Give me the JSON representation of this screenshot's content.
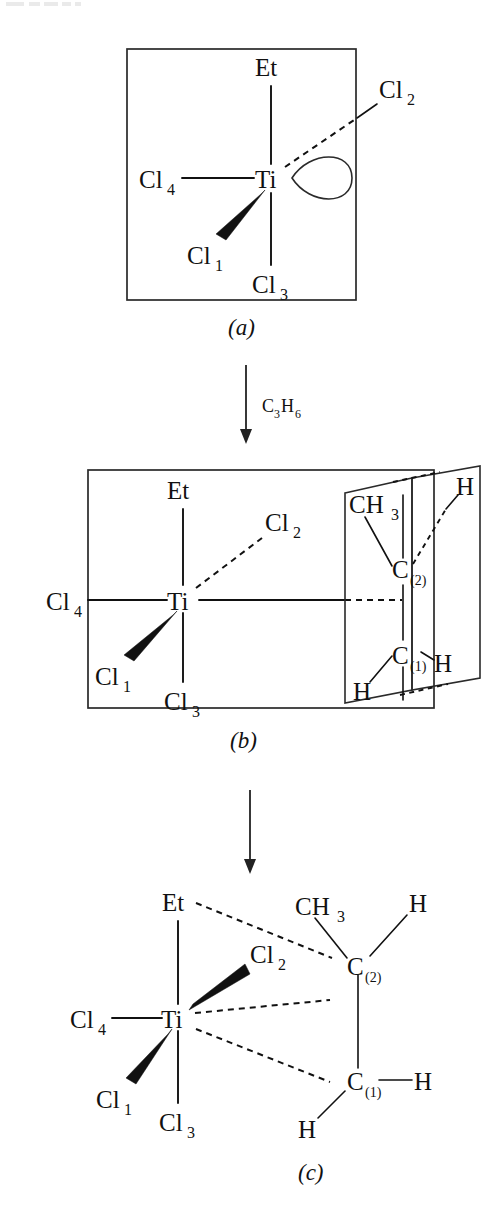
{
  "figure": {
    "kind": "reaction-mechanism-scheme",
    "background_color": "#ffffff",
    "line_color": "#111111"
  },
  "panels": [
    {
      "id": "a",
      "caption": "(a)",
      "has_box": true,
      "center_atom": "Ti",
      "ligands": [
        {
          "label": "Et",
          "sub": "",
          "bond": "plain",
          "position": "up"
        },
        {
          "label": "Cl",
          "sub": "4",
          "bond": "plain",
          "position": "left"
        },
        {
          "label": "Cl",
          "sub": "3",
          "bond": "plain",
          "position": "down"
        },
        {
          "label": "Cl",
          "sub": "2",
          "bond": "dashed",
          "position": "upper-right"
        },
        {
          "label": "Cl",
          "sub": "1",
          "bond": "wedge",
          "position": "lower-left"
        }
      ],
      "vacant_site": {
        "shape": "lobe",
        "label": ""
      }
    },
    {
      "id": "b",
      "caption": "(b)",
      "has_box": true,
      "center_atom": "Ti",
      "ligands": [
        {
          "label": "Et",
          "sub": "",
          "bond": "plain",
          "position": "up"
        },
        {
          "label": "Cl",
          "sub": "4",
          "bond": "plain",
          "position": "left"
        },
        {
          "label": "Cl",
          "sub": "3",
          "bond": "plain",
          "position": "down"
        },
        {
          "label": "Cl",
          "sub": "2",
          "bond": "dashed",
          "position": "upper-right"
        },
        {
          "label": "Cl",
          "sub": "1",
          "bond": "wedge",
          "position": "lower-left"
        }
      ],
      "alkene_plane": {
        "carbons": [
          {
            "label": "C",
            "sub": "(2)",
            "substituents": [
              "CH3",
              "H"
            ]
          },
          {
            "label": "C",
            "sub": "(1)",
            "substituents": [
              "H",
              "H"
            ]
          }
        ],
        "methyl_label": "CH",
        "methyl_sub": "3",
        "hydrogen_label": "H",
        "coordination_bond": "dashed"
      }
    },
    {
      "id": "c",
      "caption": "(c)",
      "has_box": false,
      "center_atom": "Ti",
      "ligands": [
        {
          "label": "Et",
          "sub": "",
          "bond": "plain",
          "position": "up"
        },
        {
          "label": "Cl",
          "sub": "4",
          "bond": "plain",
          "position": "left"
        },
        {
          "label": "Cl",
          "sub": "3",
          "bond": "plain",
          "position": "down"
        },
        {
          "label": "Cl",
          "sub": "2",
          "bond": "wedge",
          "position": "upper-right"
        },
        {
          "label": "Cl",
          "sub": "1",
          "bond": "wedge",
          "position": "lower-left"
        }
      ],
      "alkene": {
        "carbons": [
          {
            "label": "C",
            "sub": "(2)",
            "substituents": [
              "CH3",
              "H"
            ]
          },
          {
            "label": "C",
            "sub": "(1)",
            "substituents": [
              "H",
              "H"
            ]
          }
        ],
        "methyl_label": "CH",
        "methyl_sub": "3",
        "hydrogen_label": "H",
        "et_to_c2_bond": "dashed",
        "ti_to_c1_bond": "dashed",
        "ti_to_c2_bond": "dashed"
      }
    }
  ],
  "arrows": [
    {
      "from": "a",
      "to": "b",
      "reagent": "C",
      "reagent_sub1": "3",
      "reagent_el2": "H",
      "reagent_sub2": "6",
      "direction": "down"
    },
    {
      "from": "b",
      "to": "c",
      "reagent": "",
      "direction": "down"
    }
  ],
  "labels": {
    "titanium": "Ti",
    "ethyl": "Et",
    "chlorine": "Cl",
    "carbon": "C",
    "hydrogen": "H",
    "methyl": "CH",
    "methyl_sub": "3",
    "cl1_sub": "1",
    "cl2_sub": "2",
    "cl3_sub": "3",
    "cl4_sub": "4",
    "c1_sub": "(1)",
    "c2_sub": "(2)",
    "panel_a": "(a)",
    "panel_b": "(b)",
    "panel_c": "(c)",
    "propene_c": "C",
    "propene_c_sub": "3",
    "propene_h": "H",
    "propene_h_sub": "6"
  }
}
